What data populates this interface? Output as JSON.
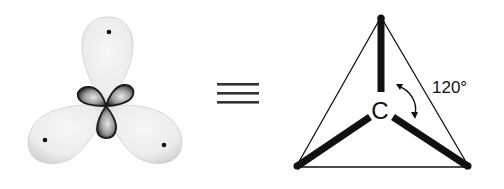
{
  "diagram": {
    "left": {
      "description": "sp2 hybrid orbital lobes of carbon in trigonal planar arrangement",
      "large_lobes": 3,
      "small_lobes": 3,
      "nucleus_dots": 3
    },
    "equivalence_symbol": "≡",
    "right": {
      "atom_label": "C",
      "angle_label": "120°",
      "bonds": 3,
      "shape": "trigonal planar"
    },
    "colors": {
      "lobe_fill": "#ececec",
      "lobe_shade": "#d4d4d4",
      "small_lobe_dark": "#2a2a2a",
      "line": "#111111",
      "background": "#ffffff"
    }
  }
}
